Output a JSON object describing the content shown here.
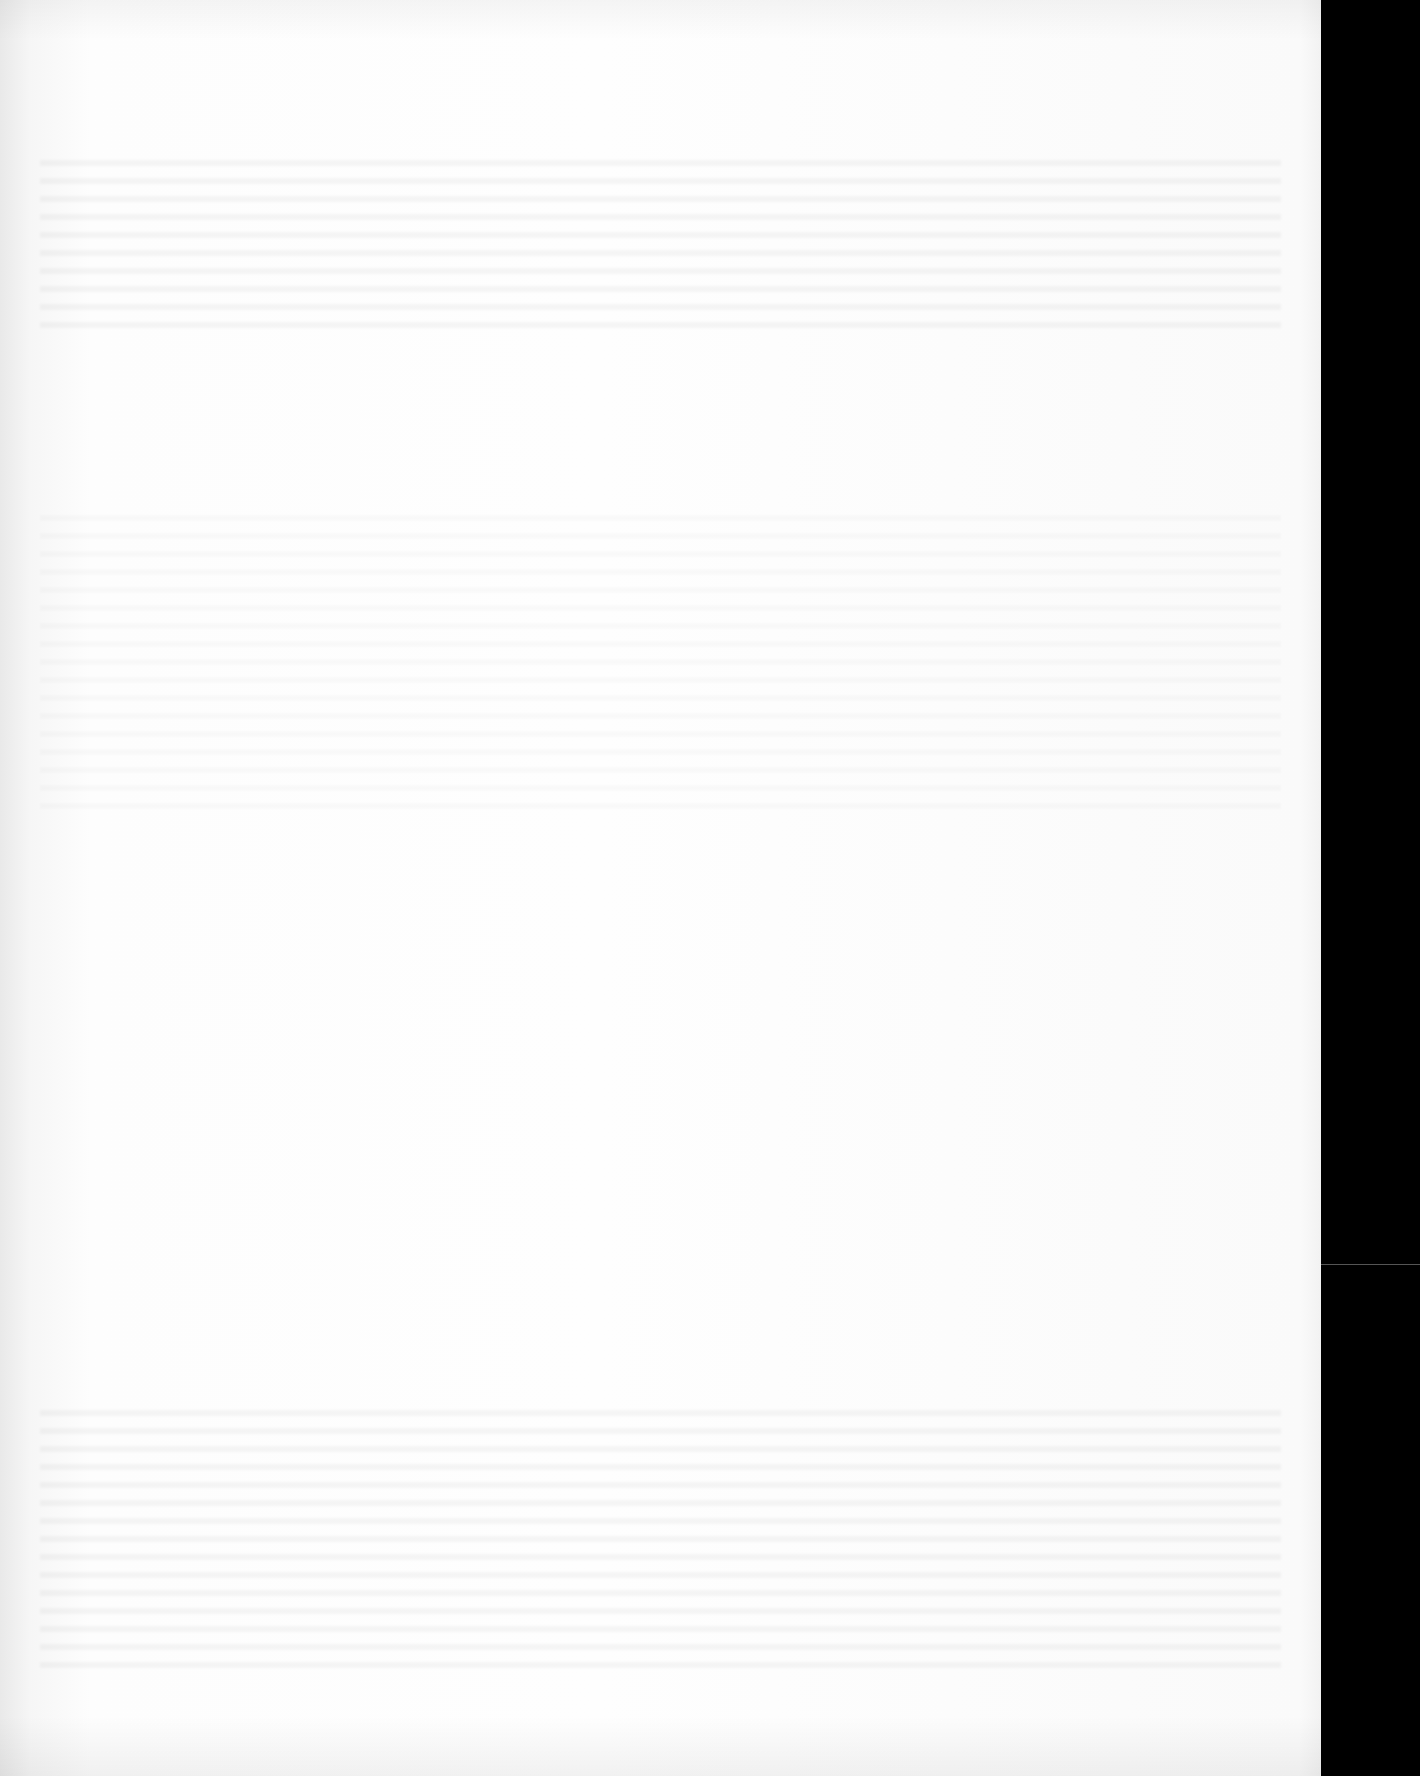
{
  "page": {
    "type": "blank scanned page",
    "content": "",
    "colors": {
      "paper": "#fdfdfd",
      "scanner_border": "#000000"
    }
  }
}
